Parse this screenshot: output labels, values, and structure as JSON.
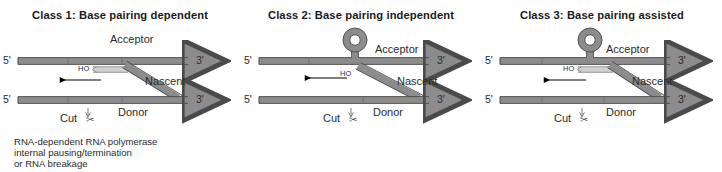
{
  "figure": {
    "background": "#ffffff",
    "colors": {
      "strand_fill": "#8c8c8c",
      "strand_stroke": "#4a4a4a",
      "pairing_fill": "#d0d0d0",
      "pairing_stroke": "#8a8a8a",
      "text": "#2b2b2b",
      "title": "#1a1a1a",
      "arrow": "#000000"
    },
    "panels": [
      {
        "id": "class-1",
        "title": "Class 1: Base pairing dependent",
        "has_hairpin": false,
        "has_pairing_segment": true,
        "labels": {
          "acceptor": "Acceptor",
          "nascent": "Nascent",
          "donor": "Donor",
          "ho": "HO",
          "cut": "Cut",
          "five_prime_top": "5'",
          "three_prime_top": "3'",
          "five_prime_bottom": "5'",
          "three_prime_bottom": "3'",
          "scissors": "✂"
        },
        "caption": "RNA-dependent RNA polymerase\ninternal pausing/termination\nor RNA breakage"
      },
      {
        "id": "class-2",
        "title": "Class 2: Base pairing independent",
        "has_hairpin": true,
        "has_pairing_segment": false,
        "labels": {
          "acceptor": "Acceptor",
          "nascent": "Nascent",
          "donor": "Donor",
          "ho": "HO",
          "cut": "Cut",
          "five_prime_top": "5'",
          "three_prime_top": "3'",
          "five_prime_bottom": "5'",
          "three_prime_bottom": "3'",
          "scissors": "✂"
        },
        "caption": ""
      },
      {
        "id": "class-3",
        "title": "Class 3: Base pairing assisted",
        "has_hairpin": true,
        "has_pairing_segment": true,
        "labels": {
          "acceptor": "Acceptor",
          "nascent": "Nascent",
          "donor": "Donor",
          "ho": "HO",
          "cut": "Cut",
          "five_prime_top": "5'",
          "three_prime_top": "3'",
          "five_prime_bottom": "5'",
          "three_prime_bottom": "3'",
          "scissors": "✂"
        },
        "caption": ""
      }
    ]
  }
}
